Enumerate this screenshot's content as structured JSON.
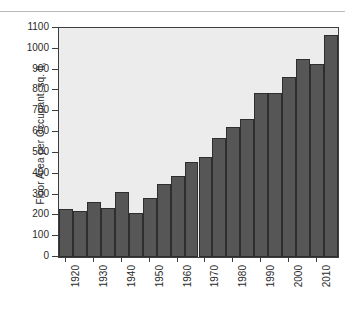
{
  "figure": {
    "background_color": "#ffffff",
    "plot_background_color": "#ececec",
    "bar_color": "#565656",
    "bar_edge_color": "#2e2e2e",
    "axis_color": "#3d3d3d",
    "text_color": "#2b2b2b"
  },
  "chart_data": {
    "type": "bar",
    "title": "",
    "xlabel": "",
    "ylabel": "Floor Area per Occupant, sq. ft,",
    "ylim": [
      0,
      1100
    ],
    "xlim": [
      1917.5,
      2017.5
    ],
    "grid": false,
    "legend": null,
    "yticks": [
      0,
      100,
      200,
      300,
      400,
      500,
      600,
      700,
      800,
      900,
      1000,
      1100
    ],
    "ytick_labels": [
      "0",
      "100",
      "200",
      "300",
      "400",
      "500",
      "600",
      "700",
      "800",
      "900",
      "1000",
      "1100"
    ],
    "xticks": [
      1920,
      1930,
      1940,
      1950,
      1960,
      1970,
      1980,
      1990,
      2000,
      2010
    ],
    "xtick_labels": [
      "1920",
      "1930",
      "1940",
      "1950",
      "1960",
      "1970",
      "1980",
      "1990",
      "2000",
      "2010"
    ],
    "bar_width_years": 5,
    "categories": [
      1920,
      1925,
      1930,
      1935,
      1940,
      1945,
      1950,
      1955,
      1960,
      1965,
      1970,
      1975,
      1980,
      1985,
      1990,
      1995,
      2000,
      2005,
      2010,
      2015
    ],
    "values": [
      230,
      222,
      265,
      237,
      313,
      213,
      285,
      350,
      387,
      455,
      481,
      570,
      625,
      665,
      787,
      787,
      865,
      950,
      925,
      1065
    ]
  }
}
